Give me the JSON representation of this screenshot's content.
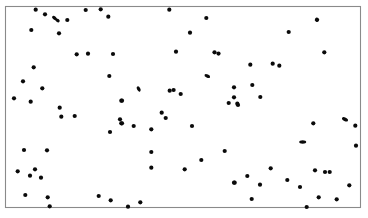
{
  "figure": {
    "title": "",
    "background_color": "#ffffff",
    "frame_color": "#8a8a8a",
    "point_color": "#0a0a0a"
  },
  "chart_data": {
    "type": "scatter",
    "title": "",
    "subtitle": "",
    "xlabel": "",
    "ylabel": "",
    "xlim": [
      0,
      356
    ],
    "ylim": [
      0,
      201
    ],
    "grid": false,
    "legend": null,
    "legend_position": "none",
    "axis_ticks": {
      "x": [],
      "y": []
    },
    "plot_area_px": {
      "left": 5,
      "top": 6,
      "right": 361,
      "bottom": 207
    },
    "marker": {
      "shape": "circle",
      "radius_px": 2.1,
      "color": "#0a0a0a"
    },
    "n_points": 139,
    "annotations": [],
    "points": [
      {
        "x": 35.7,
        "y": 9.7
      },
      {
        "x": 45.0,
        "y": 14.3
      },
      {
        "x": 54.5,
        "y": 18.0,
        "w": 5.6,
        "h": 3.4,
        "rot": 40
      },
      {
        "x": 57.5,
        "y": 20.4,
        "w": 4.8,
        "h": 3.2,
        "rot": 35
      },
      {
        "x": 67.3,
        "y": 20.0
      },
      {
        "x": 31.3,
        "y": 30.0
      },
      {
        "x": 59.0,
        "y": 33.3
      },
      {
        "x": 85.7,
        "y": 10.0
      },
      {
        "x": 100.7,
        "y": 9.3
      },
      {
        "x": 108.3,
        "y": 16.7
      },
      {
        "x": 169.3,
        "y": 9.7
      },
      {
        "x": 206.3,
        "y": 18.0
      },
      {
        "x": 317.0,
        "y": 19.7,
        "w": 4.4,
        "h": 4.4,
        "rot": 35
      },
      {
        "x": 33.7,
        "y": 67.3
      },
      {
        "x": 76.7,
        "y": 54.3
      },
      {
        "x": 88.0,
        "y": 53.7
      },
      {
        "x": 113.0,
        "y": 54.0
      },
      {
        "x": 176.0,
        "y": 51.7
      },
      {
        "x": 214.5,
        "y": 52.3
      },
      {
        "x": 218.5,
        "y": 53.6
      },
      {
        "x": 288.7,
        "y": 32.0
      },
      {
        "x": 190.0,
        "y": 32.7
      },
      {
        "x": 324.3,
        "y": 52.3
      },
      {
        "x": 250.3,
        "y": 64.7
      },
      {
        "x": 272.7,
        "y": 63.7
      },
      {
        "x": 279.3,
        "y": 65.7
      },
      {
        "x": 23.0,
        "y": 81.3
      },
      {
        "x": 42.3,
        "y": 88.3
      },
      {
        "x": 14.0,
        "y": 98.3
      },
      {
        "x": 30.7,
        "y": 101.7
      },
      {
        "x": 59.7,
        "y": 107.7
      },
      {
        "x": 61.3,
        "y": 116.7
      },
      {
        "x": 74.7,
        "y": 116.0
      },
      {
        "x": 109.3,
        "y": 76.0
      },
      {
        "x": 121.3,
        "y": 100.7
      },
      {
        "x": 120.0,
        "y": 119.3
      },
      {
        "x": 121.3,
        "y": 123.3
      },
      {
        "x": 110.0,
        "y": 132.0
      },
      {
        "x": 207.3,
        "y": 76.0,
        "w": 6.0,
        "h": 3.4,
        "rot": 25
      },
      {
        "x": 138.7,
        "y": 89.0,
        "w": 5.6,
        "h": 3.4,
        "rot": 60
      },
      {
        "x": 169.7,
        "y": 90.7
      },
      {
        "x": 173.6,
        "y": 90.0
      },
      {
        "x": 180.7,
        "y": 94.0
      },
      {
        "x": 122.0,
        "y": 100.7
      },
      {
        "x": 234.0,
        "y": 97.3
      },
      {
        "x": 228.7,
        "y": 103.0
      },
      {
        "x": 238.0,
        "y": 105.0
      },
      {
        "x": 161.7,
        "y": 112.7
      },
      {
        "x": 165.7,
        "y": 118.0
      },
      {
        "x": 122.0,
        "y": 123.3
      },
      {
        "x": 133.7,
        "y": 126.0
      },
      {
        "x": 151.3,
        "y": 129.3
      },
      {
        "x": 192.0,
        "y": 126.0
      },
      {
        "x": 234.0,
        "y": 87.3
      },
      {
        "x": 252.3,
        "y": 85.0
      },
      {
        "x": 260.3,
        "y": 97.0
      },
      {
        "x": 237.3,
        "y": 103.7
      },
      {
        "x": 313.3,
        "y": 123.3
      },
      {
        "x": 345.0,
        "y": 119.3,
        "w": 6.4,
        "h": 3.6,
        "rot": 25
      },
      {
        "x": 355.3,
        "y": 125.7
      },
      {
        "x": 24.0,
        "y": 150.0
      },
      {
        "x": 47.0,
        "y": 150.3
      },
      {
        "x": 17.7,
        "y": 171.3
      },
      {
        "x": 35.0,
        "y": 169.3
      },
      {
        "x": 30.0,
        "y": 175.7
      },
      {
        "x": 41.0,
        "y": 177.7
      },
      {
        "x": 25.3,
        "y": 195.0
      },
      {
        "x": 47.7,
        "y": 197.3
      },
      {
        "x": 49.7,
        "y": 206.3
      },
      {
        "x": 98.7,
        "y": 196.0
      },
      {
        "x": 110.7,
        "y": 200.3
      },
      {
        "x": 151.3,
        "y": 152.0
      },
      {
        "x": 151.3,
        "y": 167.7
      },
      {
        "x": 184.7,
        "y": 169.3
      },
      {
        "x": 201.3,
        "y": 160.0
      },
      {
        "x": 224.7,
        "y": 151.0
      },
      {
        "x": 234.7,
        "y": 182.7
      },
      {
        "x": 128.0,
        "y": 206.7
      },
      {
        "x": 140.3,
        "y": 202.3
      },
      {
        "x": 302.7,
        "y": 142.0,
        "w": 7.0,
        "h": 3.4,
        "rot": 0
      },
      {
        "x": 356.0,
        "y": 145.7
      },
      {
        "x": 270.7,
        "y": 168.3
      },
      {
        "x": 247.3,
        "y": 176.0
      },
      {
        "x": 234.0,
        "y": 182.7
      },
      {
        "x": 260.0,
        "y": 184.7
      },
      {
        "x": 287.3,
        "y": 180.0
      },
      {
        "x": 300.0,
        "y": 187.0
      },
      {
        "x": 315.0,
        "y": 170.3
      },
      {
        "x": 325.0,
        "y": 172.0
      },
      {
        "x": 329.7,
        "y": 172.0
      },
      {
        "x": 349.3,
        "y": 185.3
      },
      {
        "x": 318.7,
        "y": 197.3
      },
      {
        "x": 336.7,
        "y": 199.3
      },
      {
        "x": 251.7,
        "y": 199.0
      },
      {
        "x": 306.7,
        "y": 207.0
      }
    ]
  }
}
